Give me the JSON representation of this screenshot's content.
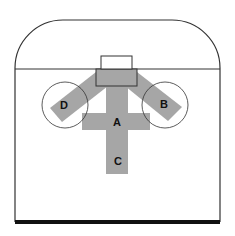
{
  "diagram": {
    "colors": {
      "stroke": "#333333",
      "fill_zone": "#a6a6a6",
      "baseline": "#111111",
      "background": "#ffffff"
    },
    "labels": {
      "A": "A",
      "B": "B",
      "C": "C",
      "D": "D"
    },
    "elements": [
      {
        "id": "outer-frame",
        "shape": "rounded-top rectangle"
      },
      {
        "id": "top-line",
        "shape": "horizontal line"
      },
      {
        "id": "small-box",
        "shape": "rectangle (outline)"
      },
      {
        "id": "center-box",
        "shape": "rectangle (filled)"
      },
      {
        "id": "zone-D",
        "shape": "diagonal bar + circle",
        "label": "D"
      },
      {
        "id": "zone-B",
        "shape": "diagonal bar + circle",
        "label": "B"
      },
      {
        "id": "zone-A",
        "shape": "cross horizontal bar",
        "label": "A"
      },
      {
        "id": "zone-C",
        "shape": "cross vertical bar",
        "label": "C"
      },
      {
        "id": "bottom-baseline",
        "shape": "thick horizontal line"
      }
    ]
  }
}
